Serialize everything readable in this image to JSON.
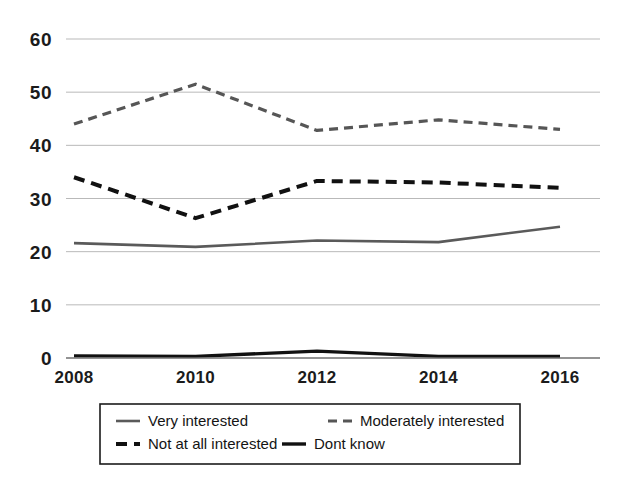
{
  "chart_data": {
    "type": "line",
    "title": "",
    "subtitle": "",
    "xlabel": "",
    "ylabel": "",
    "x": [
      2008,
      2010,
      2012,
      2014,
      2016
    ],
    "categories": [
      "2008",
      "2010",
      "2012",
      "2014",
      "2016"
    ],
    "xlim": [
      2008,
      2016
    ],
    "ylim": [
      0,
      60
    ],
    "yticks": [
      0,
      10,
      20,
      30,
      40,
      50,
      60
    ],
    "ytick_labels": [
      "0",
      "10",
      "20",
      "30",
      "40",
      "50",
      "60"
    ],
    "xticks": [
      2008,
      2010,
      2012,
      2014,
      2016
    ],
    "xtick_labels": [
      "2008",
      "2010",
      "2012",
      "2014",
      "2016"
    ],
    "grid": true,
    "grid_axis": "y",
    "legend_position": "below-plot",
    "series": [
      {
        "name": "Very interested",
        "values": [
          21.6,
          20.9,
          22.1,
          21.8,
          24.7
        ],
        "color": "#5a5a5a",
        "style": "solid",
        "width": 2.6
      },
      {
        "name": "Moderately interested",
        "values": [
          44.0,
          51.5,
          42.8,
          44.8,
          43.0
        ],
        "color": "#565656",
        "style": "dashed",
        "width": 3.2
      },
      {
        "name": "Not at all interested",
        "values": [
          34.0,
          26.3,
          33.3,
          33.0,
          32.0
        ],
        "color": "#111111",
        "style": "dashed",
        "width": 4.0
      },
      {
        "name": "Dont know",
        "values": [
          0.4,
          0.3,
          1.3,
          0.3,
          0.3
        ],
        "color": "#111111",
        "style": "solid",
        "width": 3.4
      }
    ]
  },
  "legend": {
    "entries": [
      {
        "label": "Very interested"
      },
      {
        "label": "Moderately interested"
      },
      {
        "label": "Not at all interested"
      },
      {
        "label": "Dont know"
      }
    ]
  },
  "colors": {
    "background": "#ffffff",
    "gridline": "#b9b9b9",
    "axis": "#6f6f6f",
    "text": "#1b1b1b",
    "series_gray": "#5a5a5a",
    "series_black": "#111111"
  }
}
